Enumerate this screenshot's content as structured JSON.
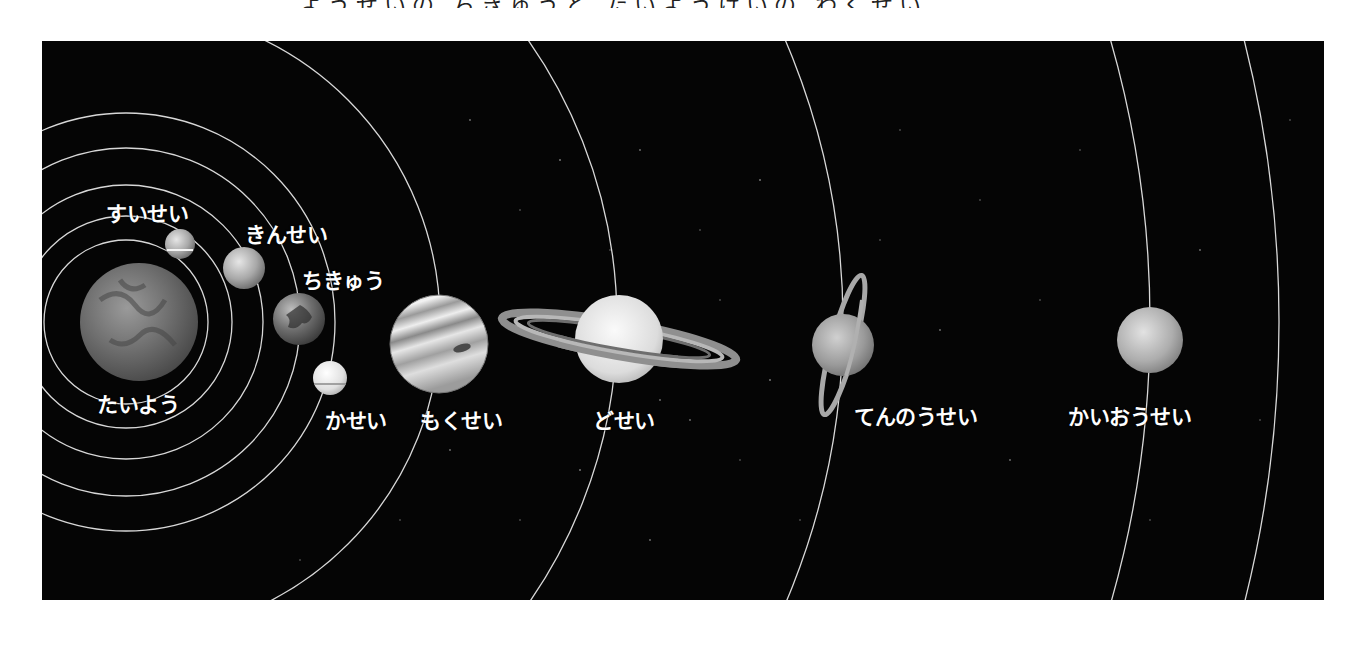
{
  "page": {
    "title_cropped": "ようせいの ちきゅうと たいようけいの わくせい"
  },
  "diagram": {
    "type": "solar-system",
    "background_color": "#050505",
    "orbit_color": "#d8d8d8",
    "sun": {
      "label": "たいよう",
      "name": "sun"
    },
    "planets": [
      {
        "name": "mercury",
        "label": "すいせい"
      },
      {
        "name": "venus",
        "label": "きんせい"
      },
      {
        "name": "earth",
        "label": "ちきゅう"
      },
      {
        "name": "mars",
        "label": "かせい"
      },
      {
        "name": "jupiter",
        "label": "もくせい"
      },
      {
        "name": "saturn",
        "label": "どせい"
      },
      {
        "name": "uranus",
        "label": "てんのうせい"
      },
      {
        "name": "neptune",
        "label": "かいおうせい"
      }
    ]
  }
}
